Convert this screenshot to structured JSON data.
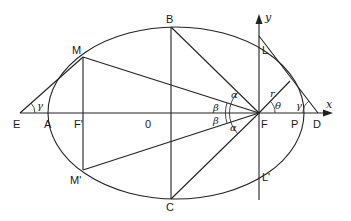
{
  "figure": {
    "type": "ellipse-geometry"
  },
  "points": {
    "E": "E",
    "A": "A",
    "F_prime": "F'",
    "O": "0",
    "F": "F",
    "P": "P",
    "D": "D",
    "B": "B",
    "C": "C",
    "M": "M",
    "M_prime": "M'",
    "L": "L",
    "L_prime": "L'"
  },
  "axes": {
    "x": "x",
    "y": "y"
  },
  "angles": {
    "gamma_left": "γ",
    "gamma_right": "γ",
    "alpha_top": "α",
    "alpha_bottom": "α",
    "beta_top": "β",
    "beta_bottom": "β",
    "theta": "θ"
  },
  "segments": {
    "r": "r"
  },
  "colors": {
    "stroke": "#222222",
    "background": "#ffffff"
  }
}
